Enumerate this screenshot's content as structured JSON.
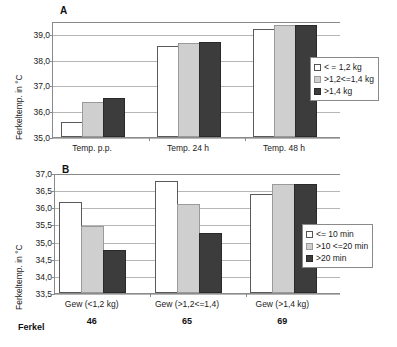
{
  "chart_data": [
    {
      "id": "A",
      "panel_letter": "A",
      "type": "bar",
      "title": "",
      "xlabel": "",
      "ylabel": "Ferkeltemp. in °C",
      "ylim": [
        35.0,
        39.5
      ],
      "yticks": [
        "35,0",
        "36,0",
        "37,0",
        "38,0",
        "39,0"
      ],
      "ytick_values": [
        35.0,
        36.0,
        37.0,
        38.0,
        39.0
      ],
      "grid": true,
      "legend_position": "right",
      "categories": [
        "Temp. p.p.",
        "Temp. 24 h",
        "Temp. 48 h"
      ],
      "series": [
        {
          "name": "< = 1,2 kg",
          "color": "#ffffff",
          "values": [
            35.6,
            38.55,
            39.2
          ]
        },
        {
          "name": ">1,2<=1,4 kg",
          "color": "#cfcfcf",
          "values": [
            36.35,
            38.65,
            39.35
          ]
        },
        {
          "name": ">1,4 kg",
          "color": "#3c3c3c",
          "values": [
            36.5,
            38.7,
            39.35
          ]
        }
      ]
    },
    {
      "id": "B",
      "panel_letter": "B",
      "type": "bar",
      "title": "",
      "xlabel": "",
      "ylabel": "Ferkeltemp. in °C",
      "ylim": [
        33.5,
        37.0
      ],
      "yticks": [
        "33,5",
        "34,0",
        "34,5",
        "35,0",
        "35,5",
        "36,0",
        "36,5",
        "37,0"
      ],
      "ytick_values": [
        33.5,
        34.0,
        34.5,
        35.0,
        35.5,
        36.0,
        36.5,
        37.0
      ],
      "grid": true,
      "legend_position": "right",
      "categories": [
        "Gew (<1,2 kg)",
        "Gew (>1,2<=1,4)",
        "Gew (>1,4 kg)"
      ],
      "series": [
        {
          "name": "<= 10 min",
          "color": "#ffffff",
          "values": [
            36.15,
            36.78,
            36.4
          ]
        },
        {
          "name": ">10 <=20 min",
          "color": "#cfcfcf",
          "values": [
            35.45,
            36.1,
            36.68
          ]
        },
        {
          "name": ">20 min",
          "color": "#3c3c3c",
          "values": [
            34.75,
            35.25,
            36.67
          ]
        }
      ],
      "footer_row": {
        "label": "Ferkel",
        "values": [
          "46",
          "65",
          "69"
        ]
      }
    }
  ]
}
